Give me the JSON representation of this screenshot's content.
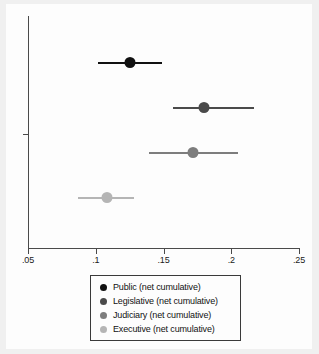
{
  "chart_data": {
    "type": "scatter",
    "title": "",
    "subtitle": "",
    "xlabel": "",
    "ylabel": "",
    "xlim": [
      0.0345,
      0.2545
    ],
    "grid": false,
    "legend_position": "bottom",
    "xticks": [
      ".05",
      ".1",
      ".15",
      ".2",
      ".25"
    ],
    "xtick_values": [
      0.05,
      0.1,
      0.15,
      0.2,
      0.25
    ],
    "ytick_values": [],
    "yticks": [],
    "orientation": "horizontal-point-estimate-with-confidence-interval",
    "series": [
      {
        "name": "Public (net cumulative)",
        "value": 0.125,
        "ci_low": 0.102,
        "ci_high": 0.149,
        "color": "#111111"
      },
      {
        "name": "Legislative (net cumulative)",
        "value": 0.18,
        "ci_low": 0.157,
        "ci_high": 0.217,
        "color": "#4a4a4a"
      },
      {
        "name": "Judiciary (net cumulative)",
        "value": 0.172,
        "ci_low": 0.139,
        "ci_high": 0.205,
        "color": "#7d7d7d"
      },
      {
        "name": "Executive (net cumulative)",
        "value": 0.108,
        "ci_low": 0.087,
        "ci_high": 0.128,
        "color": "#b5b5b5"
      }
    ]
  },
  "legend": {
    "items": [
      {
        "label": "Public (net cumulative)",
        "color": "#111111"
      },
      {
        "label": "Legislative (net cumulative)",
        "color": "#4a4a4a"
      },
      {
        "label": "Judiciary (net cumulative)",
        "color": "#7d7d7d"
      },
      {
        "label": "Executive (net cumulative)",
        "color": "#b5b5b5"
      }
    ]
  }
}
